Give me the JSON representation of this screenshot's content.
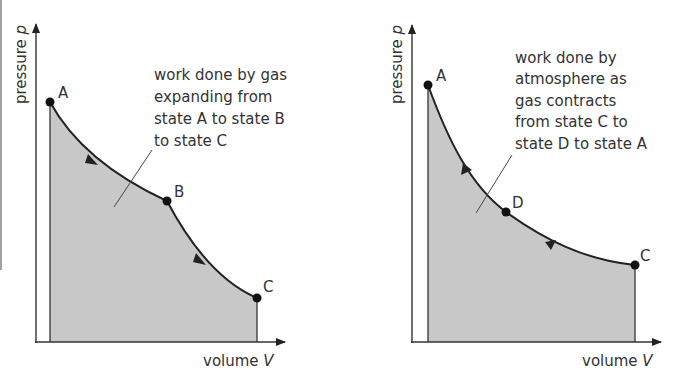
{
  "figure": {
    "shade_color": "#c8c8c8",
    "line_color": "#222222",
    "text_color": "#333333"
  },
  "left_diagram": {
    "y_axis_label": "pressure",
    "y_axis_symbol": "p",
    "x_axis_label": "volume",
    "x_axis_symbol": "V",
    "points": [
      {
        "label": "A",
        "x": 50,
        "y": 102
      },
      {
        "label": "B",
        "x": 167,
        "y": 201
      },
      {
        "label": "C",
        "x": 257,
        "y": 298
      }
    ],
    "annotation_lines": [
      "work done by gas",
      "expanding from",
      "state A to state B",
      "to state C"
    ],
    "direction": "A to B to C"
  },
  "right_diagram": {
    "y_axis_label": "pressure",
    "y_axis_symbol": "p",
    "x_axis_label": "volume",
    "x_axis_symbol": "V",
    "points": [
      {
        "label": "A",
        "x": 428,
        "y": 85
      },
      {
        "label": "D",
        "x": 506,
        "y": 212
      },
      {
        "label": "C",
        "x": 635,
        "y": 265
      }
    ],
    "annotation_lines": [
      "work done by",
      "atmosphere as",
      "gas contracts",
      "from state C to",
      "state D to state A"
    ],
    "direction": "C to D to A"
  }
}
